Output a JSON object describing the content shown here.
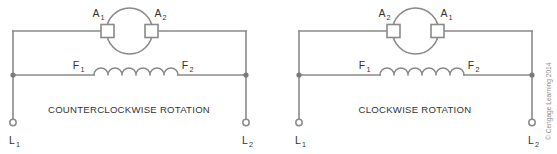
{
  "figure": {
    "background_color": "#ffffff",
    "line_color": "#8a8a8a",
    "text_color": "#333333",
    "credit": "© Cengage Learning 2014"
  },
  "diagrams": [
    {
      "id": "counterclockwise",
      "caption": "COUNTERCLOCKWISE ROTATION",
      "armature": {
        "left_terminal": "A",
        "left_terminal_sub": "1",
        "right_terminal": "A",
        "right_terminal_sub": "2"
      },
      "field": {
        "left_terminal": "F",
        "left_terminal_sub": "1",
        "right_terminal": "F",
        "right_terminal_sub": "2",
        "coil_turns": 6
      },
      "lines": {
        "left_label": "L",
        "left_label_sub": "1",
        "right_label": "L",
        "right_label_sub": "2"
      }
    },
    {
      "id": "clockwise",
      "caption": "CLOCKWISE ROTATION",
      "armature": {
        "left_terminal": "A",
        "left_terminal_sub": "2",
        "right_terminal": "A",
        "right_terminal_sub": "1"
      },
      "field": {
        "left_terminal": "F",
        "left_terminal_sub": "1",
        "right_terminal": "F",
        "right_terminal_sub": "2",
        "coil_turns": 6
      },
      "lines": {
        "left_label": "L",
        "left_label_sub": "1",
        "right_label": "L",
        "right_label_sub": "2"
      }
    }
  ]
}
